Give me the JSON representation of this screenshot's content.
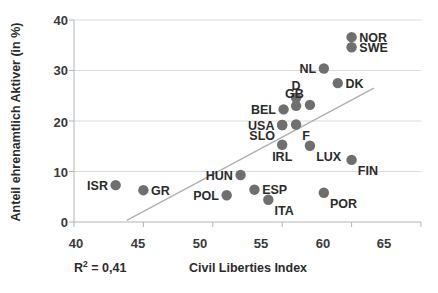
{
  "chart_data": {
    "type": "scatter",
    "title": "",
    "xlabel": "Civil Liberties Index",
    "ylabel": "Anteil ehrenamtlich Aktiver (in %)",
    "xlim": [
      40,
      65
    ],
    "ylim": [
      0,
      40
    ],
    "xticks": [
      40,
      45,
      50,
      55,
      60,
      65
    ],
    "yticks": [
      0,
      10,
      20,
      30,
      40
    ],
    "grid": true,
    "legend": "none",
    "annotations": {
      "r2_prefix": "R",
      "r2_superscript": "2",
      "r2_value": " = 0,41",
      "r2_full": "R² = 0,41"
    },
    "marker_color": "#6f6f6f",
    "trendline_color": "#b0b0b0",
    "grid_color": "#dcdcdc",
    "trendline": {
      "x0": 43.8,
      "y0": 0.3,
      "x1": 61.6,
      "y1": 26.5
    },
    "points": [
      {
        "label": "ISR",
        "x": 43.0,
        "y": 7.3,
        "label_pos": "left"
      },
      {
        "label": "GR",
        "x": 45.0,
        "y": 6.3,
        "label_pos": "right"
      },
      {
        "label": "POL",
        "x": 51.0,
        "y": 5.3,
        "label_pos": "left"
      },
      {
        "label": "HUN",
        "x": 52.0,
        "y": 9.3,
        "label_pos": "left"
      },
      {
        "label": "ESP",
        "x": 53.0,
        "y": 6.4,
        "label_pos": "right"
      },
      {
        "label": "ITA",
        "x": 54.0,
        "y": 4.4,
        "label_pos": "below-right"
      },
      {
        "label": "USA",
        "x": 55.0,
        "y": 19.2,
        "label_pos": "left"
      },
      {
        "label": "SLO",
        "x": 55.0,
        "y": 19.2,
        "label_pos": "below-left"
      },
      {
        "label": "BEL",
        "x": 55.1,
        "y": 22.3,
        "label_pos": "left"
      },
      {
        "label": "IRL",
        "x": 55.0,
        "y": 15.3,
        "label_pos": "below"
      },
      {
        "label": "D",
        "x": 56.0,
        "y": 24.6,
        "label_pos": "above"
      },
      {
        "label": "D2",
        "x": 56.0,
        "y": 23.0,
        "label_pos": "none"
      },
      {
        "label": "F",
        "x": 56.0,
        "y": 19.3,
        "label_pos": "below-right"
      },
      {
        "label": "GB",
        "x": 57.0,
        "y": 23.2,
        "label_pos": "above-left"
      },
      {
        "label": "LUX",
        "x": 57.0,
        "y": 15.1,
        "label_pos": "below-right"
      },
      {
        "label": "NL",
        "x": 58.0,
        "y": 30.4,
        "label_pos": "left"
      },
      {
        "label": "POR",
        "x": 58.0,
        "y": 5.8,
        "label_pos": "below-right"
      },
      {
        "label": "DK",
        "x": 59.0,
        "y": 27.5,
        "label_pos": "right"
      },
      {
        "label": "FIN",
        "x": 60.0,
        "y": 12.3,
        "label_pos": "below-right"
      },
      {
        "label": "NOR",
        "x": 60.0,
        "y": 36.6,
        "label_pos": "right"
      },
      {
        "label": "SWE",
        "x": 60.0,
        "y": 34.6,
        "label_pos": "right"
      }
    ]
  },
  "axis": {
    "y_title": "Anteil ehrenamtlich Aktiver (in %)",
    "x_title": "Civil Liberties Index",
    "y_tick_labels": [
      "40",
      "30",
      "20",
      "10",
      "0"
    ],
    "x_tick_labels": [
      "40",
      "45",
      "50",
      "55",
      "60",
      "65"
    ]
  }
}
